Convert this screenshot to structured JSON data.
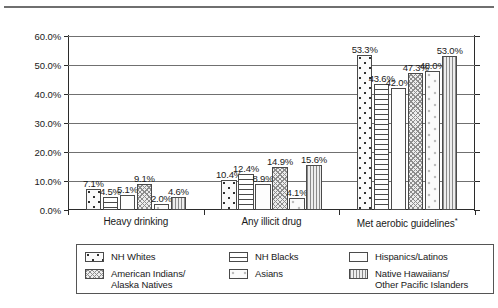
{
  "chart_data": {
    "type": "bar",
    "title": "",
    "xlabel": "",
    "ylabel": "",
    "ylim": [
      0,
      60
    ],
    "ytick_labels": [
      "0.0%",
      "10.0%",
      "20.0%",
      "30.0%",
      "40.0%",
      "50.0%",
      "60.0%"
    ],
    "ytick_values": [
      0,
      10,
      20,
      30,
      40,
      50,
      60
    ],
    "grid": true,
    "legend_position": "bottom",
    "categories": [
      "Heavy drinking",
      "Any illicit drug",
      "Met aerobic guidelines*"
    ],
    "series": [
      {
        "name": "NH Whites",
        "pattern": "dots-square",
        "values": [
          7.1,
          10.4,
          53.3
        ],
        "labels": [
          "7.1%",
          "10.4%",
          "53.3%"
        ]
      },
      {
        "name": "NH Blacks",
        "pattern": "horizontal-lines",
        "values": [
          4.5,
          12.4,
          43.6
        ],
        "labels": [
          "4.5%",
          "12.4%",
          "43.6%"
        ]
      },
      {
        "name": "Hispanics/Latinos",
        "pattern": "fine-stipple",
        "values": [
          5.1,
          8.9,
          42.0
        ],
        "labels": [
          "5.1%",
          "8.9%",
          "42.0%"
        ]
      },
      {
        "name": "American Indians/\nAlaska Natives",
        "pattern": "cross-hatch",
        "values": [
          9.1,
          14.9,
          47.3
        ],
        "labels": [
          "9.1%",
          "14.9%",
          "47.3%"
        ]
      },
      {
        "name": "Asians",
        "pattern": "sparse-circles",
        "values": [
          2.0,
          4.1,
          48.0
        ],
        "labels": [
          "2.0%",
          "4.1%",
          "48.0%"
        ]
      },
      {
        "name": "Native Hawaiians/\nOther Pacific Islanders",
        "pattern": "vertical-lines",
        "values": [
          4.6,
          15.6,
          53.0
        ],
        "labels": [
          "4.6%",
          "15.6%",
          "53.0%"
        ]
      }
    ]
  },
  "axis": {
    "y_labels": [
      "60.0%",
      "50.0%",
      "40.0%",
      "30.0%",
      "20.0%",
      "10.0%",
      "0.0%"
    ],
    "category_labels": [
      "Heavy drinking",
      "Any illicit drug",
      "Met aerobic guidelines"
    ],
    "footnote_marker": "*"
  },
  "legend": {
    "columns": [
      [
        {
          "label": "NH Whites",
          "pattern": "p-whites",
          "swatch_name": "legend-swatch-nh-whites"
        },
        {
          "label": "American Indians/\nAlaska Natives",
          "pattern": "p-amind",
          "swatch_name": "legend-swatch-american-indians"
        }
      ],
      [
        {
          "label": "NH Blacks",
          "pattern": "p-blacks",
          "swatch_name": "legend-swatch-nh-blacks"
        },
        {
          "label": "Asians",
          "pattern": "p-asian",
          "swatch_name": "legend-swatch-asians"
        }
      ],
      [
        {
          "label": "Hispanics/Latinos",
          "pattern": "p-hisp",
          "swatch_name": "legend-swatch-hispanics-latinos"
        },
        {
          "label": "Native Hawaiians/\nOther Pacific Islanders",
          "pattern": "p-nhopi",
          "swatch_name": "legend-swatch-native-hawaiians"
        }
      ]
    ]
  },
  "colors": {
    "axis": "#2b2b2b",
    "gridline": "#707070",
    "rule": "#6f6f6f",
    "text": "#1a1a1a",
    "background": "#ffffff"
  }
}
